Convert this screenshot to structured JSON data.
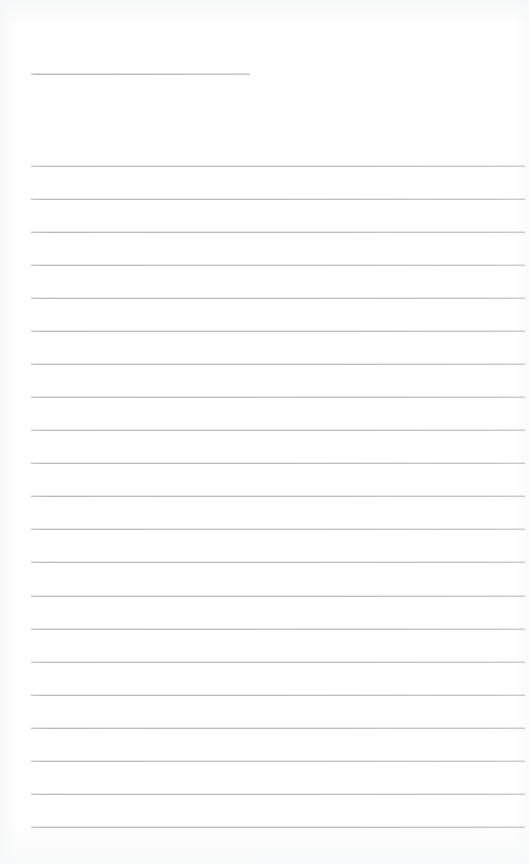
{
  "page": {
    "label": "Scanned blank ruled page",
    "width": 529,
    "height": 864,
    "background_color": "#ffffff",
    "text_content": ""
  },
  "ink": {
    "rule_color": "#c9c9c9",
    "rule_shadow_color": "#b4b4b4",
    "rule_thickness_px": 1
  },
  "margins": {
    "left_px": 31,
    "right_px": 525,
    "top_blank_px": 74,
    "bottom_blank_px": 827
  },
  "header_rule": {
    "name": "header-fill-in-rule",
    "y": 74,
    "x_start": 31,
    "x_end": 250,
    "length_px": 219,
    "value": ""
  },
  "body_rules": {
    "count": 21,
    "first_y": 166,
    "spacing_px": 33.05,
    "x_start": 31,
    "x_end": 525,
    "length_px": 494,
    "lines": [
      {
        "index": 1,
        "y": 166,
        "value": ""
      },
      {
        "index": 2,
        "y": 199,
        "value": ""
      },
      {
        "index": 3,
        "y": 232,
        "value": ""
      },
      {
        "index": 4,
        "y": 265,
        "value": ""
      },
      {
        "index": 5,
        "y": 298,
        "value": ""
      },
      {
        "index": 6,
        "y": 331,
        "value": ""
      },
      {
        "index": 7,
        "y": 364,
        "value": ""
      },
      {
        "index": 8,
        "y": 397,
        "value": ""
      },
      {
        "index": 9,
        "y": 430,
        "value": ""
      },
      {
        "index": 10,
        "y": 463,
        "value": ""
      },
      {
        "index": 11,
        "y": 496,
        "value": ""
      },
      {
        "index": 12,
        "y": 529,
        "value": ""
      },
      {
        "index": 13,
        "y": 562,
        "value": ""
      },
      {
        "index": 14,
        "y": 596,
        "value": ""
      },
      {
        "index": 15,
        "y": 629,
        "value": ""
      },
      {
        "index": 16,
        "y": 662,
        "value": ""
      },
      {
        "index": 17,
        "y": 695,
        "value": ""
      },
      {
        "index": 18,
        "y": 728,
        "value": ""
      },
      {
        "index": 19,
        "y": 761,
        "value": ""
      },
      {
        "index": 20,
        "y": 794,
        "value": ""
      },
      {
        "index": 21,
        "y": 827,
        "value": ""
      }
    ]
  }
}
